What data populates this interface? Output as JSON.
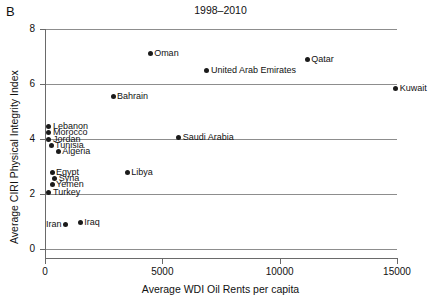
{
  "panel": {
    "label": "B"
  },
  "chart_data": {
    "type": "scatter",
    "title": "1998–2010",
    "xlabel": "Average WDI Oil Rents per capita",
    "ylabel": "Average CIRI Physical Integrity Index",
    "xlim": [
      0,
      15000
    ],
    "ylim": [
      0,
      8
    ],
    "xticks": [
      "0",
      "5000",
      "10000",
      "15000"
    ],
    "xtick_values": [
      0,
      5000,
      10000,
      15000
    ],
    "yticks": [
      "0",
      "2",
      "4",
      "6",
      "8"
    ],
    "ytick_values": [
      0,
      2,
      4,
      6,
      8
    ],
    "grid": true,
    "legend": null,
    "points": [
      {
        "name": "Oman",
        "x": 4480,
        "y": 7.1,
        "label_side": "right"
      },
      {
        "name": "Qatar",
        "x": 11180,
        "y": 6.9,
        "label_side": "right"
      },
      {
        "name": "United Arab Emirates",
        "x": 6900,
        "y": 6.5,
        "label_side": "right"
      },
      {
        "name": "Kuwait",
        "x": 14950,
        "y": 5.85,
        "label_side": "right"
      },
      {
        "name": "Bahrain",
        "x": 2900,
        "y": 5.55,
        "label_side": "right"
      },
      {
        "name": "Lebanon",
        "x": 170,
        "y": 4.45,
        "label_side": "right"
      },
      {
        "name": "Morocco",
        "x": 170,
        "y": 4.22,
        "label_side": "right"
      },
      {
        "name": "Jordan",
        "x": 170,
        "y": 4.0,
        "label_side": "right"
      },
      {
        "name": "Saudi Arabia",
        "x": 5700,
        "y": 4.05,
        "label_side": "right"
      },
      {
        "name": "Tunisia",
        "x": 260,
        "y": 3.78,
        "label_side": "right"
      },
      {
        "name": "Algeria",
        "x": 560,
        "y": 3.55,
        "label_side": "right"
      },
      {
        "name": "Egypt",
        "x": 300,
        "y": 2.8,
        "label_side": "right"
      },
      {
        "name": "Libya",
        "x": 3500,
        "y": 2.78,
        "label_side": "right"
      },
      {
        "name": "Syria",
        "x": 420,
        "y": 2.55,
        "label_side": "right"
      },
      {
        "name": "Yemen",
        "x": 300,
        "y": 2.35,
        "label_side": "right"
      },
      {
        "name": "Turkey",
        "x": 170,
        "y": 2.05,
        "label_side": "right"
      },
      {
        "name": "Iran",
        "x": 870,
        "y": 0.88,
        "label_side": "left"
      },
      {
        "name": "Iraq",
        "x": 1500,
        "y": 0.95,
        "label_side": "right"
      }
    ]
  }
}
